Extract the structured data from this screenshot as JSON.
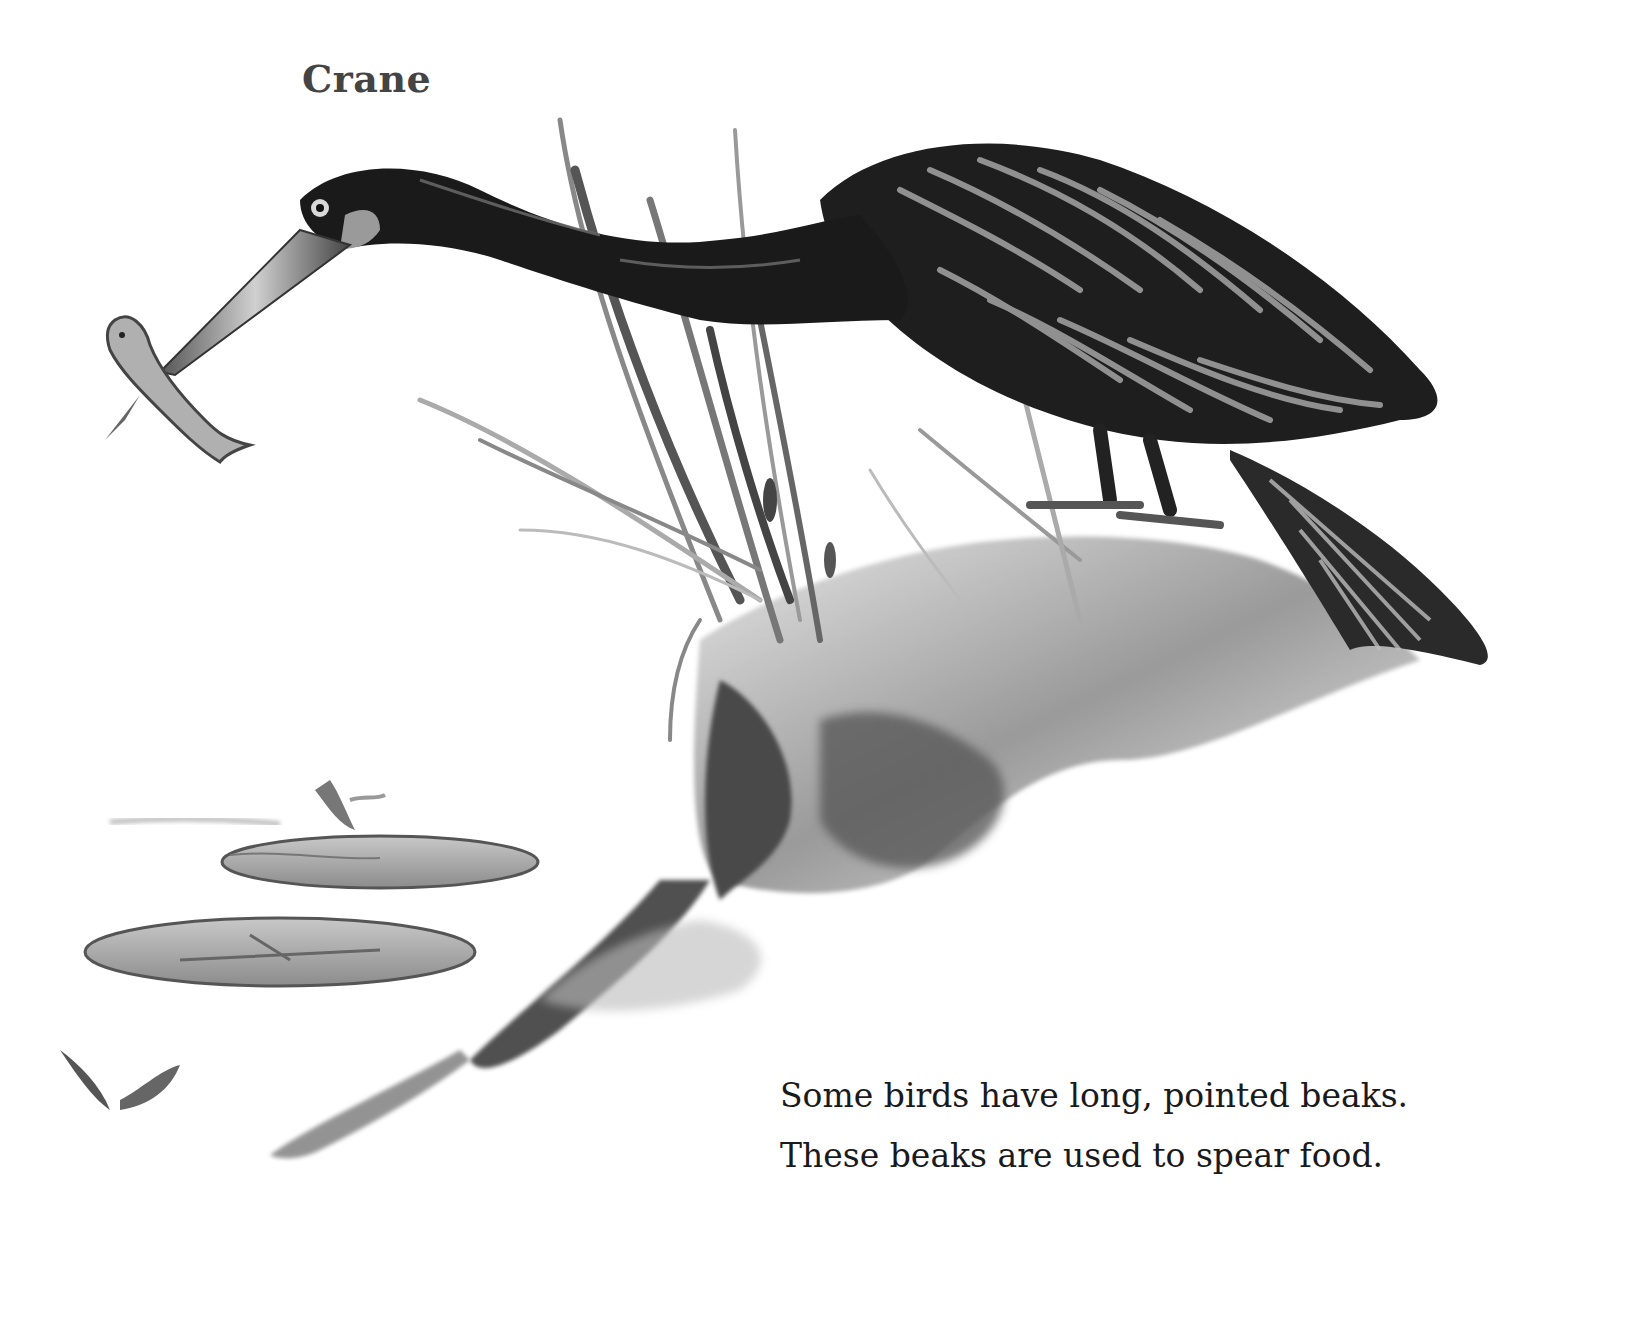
{
  "page": {
    "title": "Crane",
    "caption": {
      "lines": [
        "Some birds have long, pointed beaks.",
        "These beaks are used to spear food."
      ]
    },
    "illustration": {
      "subject": "crane-spearing-fish",
      "elements": [
        "crane",
        "fish",
        "reeds",
        "rock",
        "lily-pads",
        "water"
      ],
      "style": "black-and-white painting"
    }
  },
  "colors": {
    "background": "#ffffff",
    "title_text": "#444444",
    "caption_text": "#1a1a1a",
    "bird_dark": "#1c1c1c",
    "feather_light": "#9a9a9a",
    "rock_gray": "#7a7a7a",
    "lily_pad": "#a8a8a8"
  }
}
